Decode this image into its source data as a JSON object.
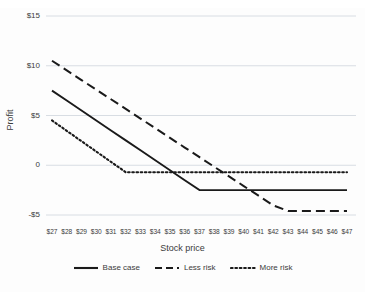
{
  "chart_data": {
    "type": "line",
    "title": "",
    "xlabel": "Stock price",
    "ylabel": "Profit",
    "grid": true,
    "legend_position": "bottom",
    "xlim": [
      27,
      47
    ],
    "ylim": [
      -5,
      15
    ],
    "x": [
      27,
      28,
      29,
      30,
      31,
      32,
      33,
      34,
      35,
      36,
      37,
      38,
      39,
      40,
      41,
      42,
      43,
      44,
      45,
      46,
      47
    ],
    "x_tick_labels": [
      "$27",
      "$28",
      "$29",
      "$30",
      "$31",
      "$32",
      "$33",
      "$34",
      "$35",
      "$36",
      "$37",
      "$38",
      "$39",
      "$40",
      "$41",
      "$42",
      "$43",
      "$44",
      "$45",
      "$46",
      "$47"
    ],
    "y_ticks": [
      15,
      10,
      5,
      0,
      -5
    ],
    "y_tick_labels": [
      "$15",
      "$10",
      "$5",
      "0",
      "-$5"
    ],
    "series": [
      {
        "name": "Base case",
        "style": "solid",
        "color": "#1a1a1a",
        "values": [
          7.5,
          6.5,
          5.5,
          4.5,
          3.5,
          2.5,
          1.5,
          0.5,
          -0.5,
          -1.5,
          -2.5,
          -2.5,
          -2.5,
          -2.5,
          -2.5,
          -2.5,
          -2.5,
          -2.5,
          -2.5,
          -2.5,
          -2.5
        ]
      },
      {
        "name": "Less risk",
        "style": "dashed",
        "color": "#1a1a1a",
        "values": [
          10.5,
          9.53,
          8.56,
          7.59,
          6.63,
          5.66,
          4.69,
          3.72,
          2.75,
          1.78,
          0.81,
          -0.16,
          -1.12,
          -2.09,
          -3.06,
          -4.03,
          -4.6,
          -4.6,
          -4.6,
          -4.6,
          -4.6
        ]
      },
      {
        "name": "More risk",
        "style": "dotted",
        "color": "#1a1a1a",
        "values": [
          4.5,
          3.46,
          2.42,
          1.38,
          0.34,
          -0.7,
          -0.7,
          -0.7,
          -0.7,
          -0.7,
          -0.7,
          -0.7,
          -0.7,
          -0.7,
          -0.7,
          -0.7,
          -0.7,
          -0.7,
          -0.7,
          -0.7,
          -0.7
        ]
      }
    ]
  },
  "axes": {
    "y_label": "Profit",
    "x_label": "Stock price",
    "y_tick_labels": [
      "$15",
      "$10",
      "$5",
      "0",
      "-$5"
    ],
    "x_tick_labels": [
      "$27",
      "$28",
      "$29",
      "$30",
      "$31",
      "$32",
      "$33",
      "$34",
      "$35",
      "$36",
      "$37",
      "$38",
      "$39",
      "$40",
      "$41",
      "$42",
      "$43",
      "$44",
      "$45",
      "$46",
      "$47"
    ]
  },
  "legend": {
    "items": [
      {
        "label": "Base case",
        "style": "solid"
      },
      {
        "label": "Less risk",
        "style": "dashed"
      },
      {
        "label": "More risk",
        "style": "dotted"
      }
    ]
  },
  "colors": {
    "line": "#1a1a1a",
    "grid": "#d8dde3",
    "background": "#fdfdfd",
    "text": "#3b3b3b"
  }
}
